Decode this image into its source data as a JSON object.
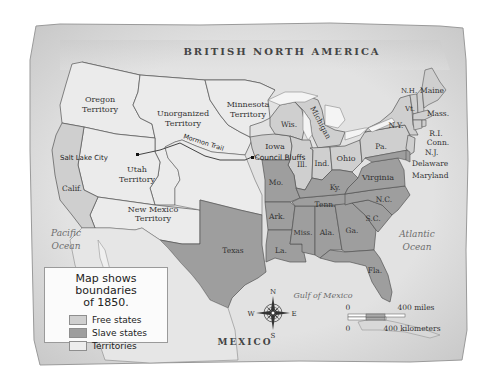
{
  "map": {
    "title_region": "BRITISH NORTH AMERICA",
    "colors": {
      "paper": "#e4e4e4",
      "free_state": "#cfcfcf",
      "slave_state": "#9e9e9e",
      "territory": "#ebebeb",
      "water": "#f2f2f2",
      "border": "#555555"
    },
    "regions": {
      "countries": {
        "north": "BRITISH NORTH AMERICA",
        "south": "MEXICO"
      },
      "oceans": {
        "pacific_1": "Pacific",
        "pacific_2": "Ocean",
        "atlantic_1": "Atlantic",
        "atlantic_2": "Ocean",
        "gulf": "Gulf of Mexico"
      },
      "territories": {
        "oregon_1": "Oregon",
        "oregon_2": "Territory",
        "unorganized_1": "Unorganized",
        "unorganized_2": "Territory",
        "minnesota_1": "Minnesota",
        "minnesota_2": "Territory",
        "utah_1": "Utah",
        "utah_2": "Territory",
        "new_mexico_1": "New Mexico",
        "new_mexico_2": "Territory"
      },
      "free_states": [
        "Calif.",
        "Iowa",
        "Wis.",
        "Michigan",
        "Ill.",
        "Ind.",
        "Ohio",
        "Pa.",
        "N.Y.",
        "Vt.",
        "N.H.",
        "Maine",
        "Mass.",
        "R.I.",
        "Conn.",
        "N.J."
      ],
      "slave_states": [
        "Texas",
        "Mo.",
        "Ark.",
        "La.",
        "Miss.",
        "Ala.",
        "Tenn.",
        "Ky.",
        "Ga.",
        "Fla.",
        "S.C.",
        "N.C.",
        "Virginia",
        "Delaware",
        "Maryland"
      ]
    },
    "labels": {
      "calif": "Calif.",
      "texas": "Texas",
      "iowa": "Iowa",
      "wis": "Wis.",
      "michigan": "Michigan",
      "ill": "Ill.",
      "ind": "Ind.",
      "ohio": "Ohio",
      "pa": "Pa.",
      "ny": "N.Y.",
      "vt": "Vt.",
      "nh": "N.H.",
      "maine": "Maine",
      "mass": "Mass.",
      "ri": "R.I.",
      "conn": "Conn.",
      "nj": "N.J.",
      "delaware": "Delaware",
      "maryland": "Maryland",
      "virginia": "Virginia",
      "ky": "Ky.",
      "mo": "Mo.",
      "tenn": "Tenn.",
      "nc": "N.C.",
      "sc": "S.C.",
      "ark": "Ark.",
      "miss": "Miss.",
      "ala": "Ala.",
      "ga": "Ga.",
      "la": "La.",
      "fla": "Fla."
    },
    "places": {
      "salt_lake_city": "Salt Lake City",
      "council_bluffs": "Council Bluffs"
    },
    "routes": {
      "mormon_trail": "Mormon Trail"
    },
    "compass": {
      "n": "N",
      "s": "S",
      "e": "E",
      "w": "W"
    },
    "scale": {
      "miles_zero": "0",
      "miles_label": "400 miles",
      "km_zero": "0",
      "km_label": "400 kilometers"
    }
  },
  "legend": {
    "title_line1": "Map shows boundaries",
    "title_line2": "of 1850.",
    "items": [
      {
        "label": "Free states",
        "color": "#cfcfcf"
      },
      {
        "label": "Slave states",
        "color": "#9e9e9e"
      },
      {
        "label": "Territories",
        "color": "#ededed"
      }
    ]
  }
}
